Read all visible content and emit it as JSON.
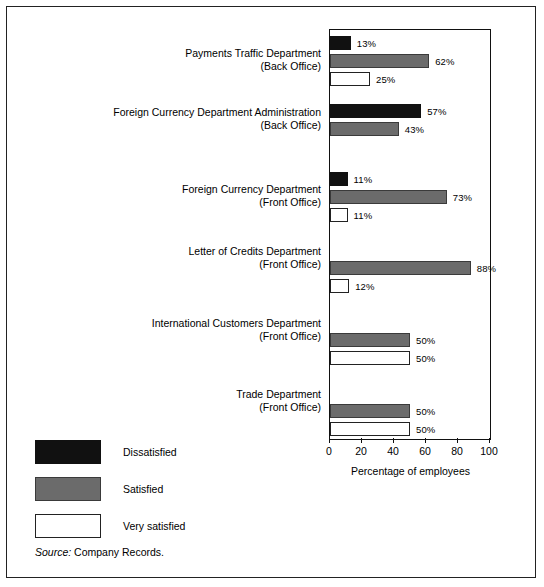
{
  "chart_data": {
    "type": "bar",
    "orientation": "horizontal",
    "title": "",
    "xlabel": "Percentage of employees",
    "ylabel": "",
    "xlim": [
      0,
      100
    ],
    "xticks": [
      "0",
      "20",
      "40",
      "60",
      "80",
      "100"
    ],
    "grid": false,
    "legend_position": "bottom-left",
    "categories": [
      "Payments Traffic Department (Back Office)",
      "Foreign Currency Department Administration (Back Office)",
      "Foreign Currency Department (Front Office)",
      "Letter of Credits Department (Front Office)",
      "International Customers Department (Front Office)",
      "Trade Department (Front Office)"
    ],
    "series": [
      {
        "name": "Dissatisfied",
        "color": "#111111",
        "values": [
          13,
          57,
          11,
          0,
          0,
          0
        ]
      },
      {
        "name": "Satisfied",
        "color": "#6b6b6b",
        "values": [
          62,
          43,
          73,
          88,
          50,
          50
        ]
      },
      {
        "name": "Very satisfied",
        "color": "#ffffff",
        "values": [
          25,
          0,
          11,
          12,
          50,
          50
        ]
      }
    ]
  },
  "groups": [
    {
      "label_line1": "Payments Traffic Department",
      "label_line2": "(Back Office)",
      "bars": [
        {
          "series": "Dissatisfied",
          "value": 13,
          "label": "13%"
        },
        {
          "series": "Satisfied",
          "value": 62,
          "label": "62%"
        },
        {
          "series": "Very satisfied",
          "value": 25,
          "label": "25%"
        }
      ]
    },
    {
      "label_line1": "Foreign Currency Department Administration",
      "label_line2": "(Back Office)",
      "bars": [
        {
          "series": "Dissatisfied",
          "value": 57,
          "label": "57%"
        },
        {
          "series": "Satisfied",
          "value": 43,
          "label": "43%"
        },
        {
          "series": "Very satisfied",
          "value": 0,
          "label": ""
        }
      ]
    },
    {
      "label_line1": "Foreign Currency Department",
      "label_line2": "(Front Office)",
      "bars": [
        {
          "series": "Dissatisfied",
          "value": 11,
          "label": "11%"
        },
        {
          "series": "Satisfied",
          "value": 73,
          "label": "73%"
        },
        {
          "series": "Very satisfied",
          "value": 11,
          "label": "11%"
        }
      ]
    },
    {
      "label_line1": "Letter of Credits Department",
      "label_line2": "(Front Office)",
      "bars": [
        {
          "series": "Dissatisfied",
          "value": 0,
          "label": ""
        },
        {
          "series": "Satisfied",
          "value": 88,
          "label": "88%"
        },
        {
          "series": "Very satisfied",
          "value": 12,
          "label": "12%"
        }
      ]
    },
    {
      "label_line1": "International Customers Department",
      "label_line2": "(Front Office)",
      "bars": [
        {
          "series": "Dissatisfied",
          "value": 0,
          "label": ""
        },
        {
          "series": "Satisfied",
          "value": 50,
          "label": "50%"
        },
        {
          "series": "Very satisfied",
          "value": 50,
          "label": "50%"
        }
      ]
    },
    {
      "label_line1": "Trade Department",
      "label_line2": "(Front Office)",
      "bars": [
        {
          "series": "Dissatisfied",
          "value": 0,
          "label": ""
        },
        {
          "series": "Satisfied",
          "value": 50,
          "label": "50%"
        },
        {
          "series": "Very satisfied",
          "value": 50,
          "label": "50%"
        }
      ]
    }
  ],
  "axis": {
    "title": "Percentage of employees",
    "ticks": [
      {
        "value": 0,
        "label": "0"
      },
      {
        "value": 20,
        "label": "20"
      },
      {
        "value": 40,
        "label": "40"
      },
      {
        "value": 60,
        "label": "60"
      },
      {
        "value": 80,
        "label": "80"
      },
      {
        "value": 100,
        "label": "100"
      }
    ]
  },
  "legend": {
    "items": [
      {
        "label": "Dissatisfied",
        "swatch": "dissatisfied",
        "color": "#111111"
      },
      {
        "label": "Satisfied",
        "swatch": "satisfied",
        "color": "#6b6b6b"
      },
      {
        "label": "Very satisfied",
        "swatch": "very",
        "color": "#ffffff"
      }
    ]
  },
  "source": {
    "prefix": "Source:",
    "text": "Company Records."
  }
}
